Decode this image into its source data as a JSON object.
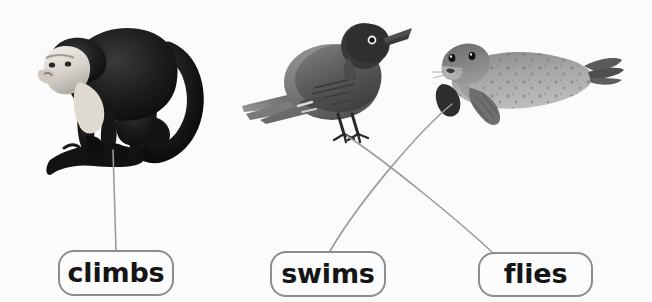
{
  "activity": {
    "type": "matching-activity",
    "background_color": "#fbfbfb",
    "width": 652,
    "height": 302
  },
  "images": [
    {
      "id": "monkey",
      "name": "capuchin-monkey-photo",
      "description": "Black and white photograph of a white-faced capuchin monkey standing on a branch",
      "x": 20,
      "y": 8,
      "width": 190,
      "height": 172
    },
    {
      "id": "bird",
      "name": "robin-photo",
      "description": "Black and white photograph of an American robin perched, facing right",
      "x": 240,
      "y": 10,
      "width": 172,
      "height": 138
    },
    {
      "id": "seal",
      "name": "seal-photo",
      "description": "Black and white photograph of a spotted harbor seal lying with head raised to the left",
      "x": 424,
      "y": 22,
      "width": 200,
      "height": 108
    }
  ],
  "labels": [
    {
      "id": "climbs",
      "text": "climbs",
      "x": 58,
      "y": 250,
      "width": 116,
      "height": 46
    },
    {
      "id": "swims",
      "text": "swims",
      "x": 270,
      "y": 251,
      "width": 116,
      "height": 46
    },
    {
      "id": "flies",
      "text": "flies",
      "x": 478,
      "y": 252,
      "width": 115,
      "height": 45
    }
  ],
  "connectors": [
    {
      "id": "monkey-to-climbs",
      "from": "monkey",
      "to": "climbs",
      "start_x": 113,
      "start_y": 150,
      "end_x": 116,
      "end_y": 250,
      "color": "#9a9a9a"
    },
    {
      "id": "bird-to-flies",
      "from": "bird",
      "to": "flies",
      "start_x": 347,
      "start_y": 136,
      "end_x": 492,
      "end_y": 252,
      "color": "#9a9a9a"
    },
    {
      "id": "seal-to-swims",
      "from": "seal",
      "to": "swims",
      "start_x": 452,
      "start_y": 104,
      "end_x": 330,
      "end_y": 251,
      "color": "#9a9a9a"
    }
  ],
  "style": {
    "pill_border_color": "#8d8d8d",
    "pill_fill_color": "#fcfcfc",
    "text_color": "#151515",
    "connector_color": "#9a9a9a"
  }
}
